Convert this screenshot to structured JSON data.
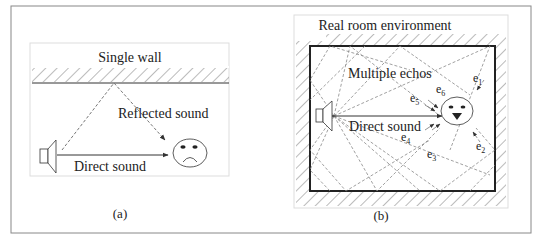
{
  "figure": {
    "panel_a": {
      "wall_label": "Single wall",
      "reflected_label": "Reflected sound",
      "direct_label": "Direct sound",
      "caption": "(a)",
      "listener_expression": "sad"
    },
    "panel_b": {
      "title": "Real room environment",
      "echos_label": "Multiple echos",
      "direct_label": "Direct sound",
      "caption": "(b)",
      "listener_expression": "happy",
      "echo_labels": [
        {
          "base": "e",
          "sub": "1"
        },
        {
          "base": "e",
          "sub": "2"
        },
        {
          "base": "e",
          "sub": "3"
        },
        {
          "base": "e",
          "sub": "4"
        },
        {
          "base": "e",
          "sub": "5"
        },
        {
          "base": "e",
          "sub": "6"
        }
      ]
    },
    "colors": {
      "line": "#333333",
      "dashed": "#777777",
      "border": "#888888",
      "panel_border": "#dddddd"
    }
  }
}
